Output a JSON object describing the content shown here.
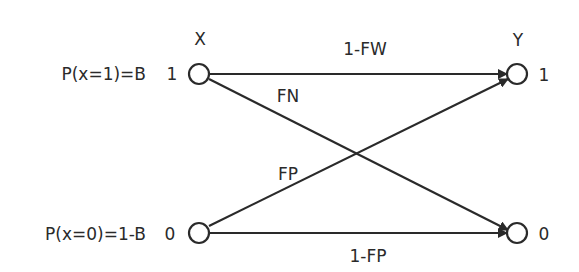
{
  "diagram": {
    "type": "binary channel",
    "input_header": "X",
    "output_header": "Y",
    "inputs": [
      {
        "prob_label": "P(x=1)=B",
        "state": "1"
      },
      {
        "prob_label": "P(x=0)=1-B",
        "state": "0"
      }
    ],
    "outputs": [
      {
        "state": "1"
      },
      {
        "state": "0"
      }
    ],
    "edges": [
      {
        "from": "1",
        "to": "1",
        "label": "1-FW"
      },
      {
        "from": "1",
        "to": "0",
        "label": "FN"
      },
      {
        "from": "0",
        "to": "1",
        "label": "FP"
      },
      {
        "from": "0",
        "to": "0",
        "label": "1-FP"
      }
    ],
    "colors": {
      "stroke": "#2a2a2a",
      "background": "#ffffff"
    }
  }
}
